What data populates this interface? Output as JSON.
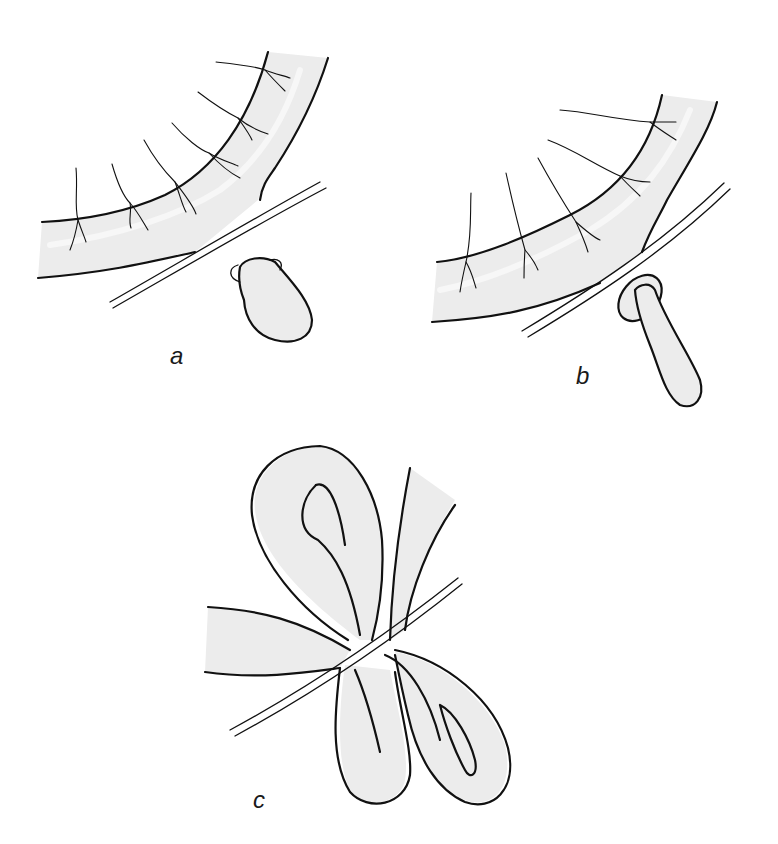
{
  "figure": {
    "panels": [
      {
        "id": "a",
        "label": "a",
        "description": "Curved tubular structure with radiating vessels; a rounded bulbous sac with a small everted rim sits just below a double-line band crossing beneath the curve."
      },
      {
        "id": "b",
        "label": "b",
        "description": "Same curved structure with radiating vessels; an elongated sac with a wide oval collar/rim sits below the double-line band."
      },
      {
        "id": "c",
        "label": "c",
        "description": "Looped tubular structure forming two loops (upper and lower) crossed by a double-line band at the center."
      }
    ],
    "colors": {
      "background": "#ffffff",
      "fill": "#ececec",
      "ink": "#111111"
    }
  }
}
